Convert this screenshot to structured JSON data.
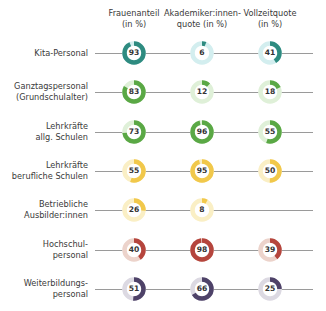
{
  "chart_data": {
    "type": "donut-matrix",
    "title": "",
    "columns": [
      "Frauenanteil (in %)",
      "Akademiker:innen-quote (in %)",
      "Vollzeitquote (in %)"
    ],
    "rows": [
      {
        "label": [
          "Kita-Personal"
        ],
        "values": [
          93,
          6,
          41
        ],
        "color": "#2e8b80",
        "track": "#d3eeef"
      },
      {
        "label": [
          "Ganztagspersonal",
          "(Grundschulalter)"
        ],
        "values": [
          83,
          12,
          18
        ],
        "color": "#5aa845",
        "track": "#dff0d8"
      },
      {
        "label": [
          "Lehrkräfte",
          "allg. Schulen"
        ],
        "values": [
          73,
          96,
          55
        ],
        "color": "#5aa845",
        "track": "#dff0d8"
      },
      {
        "label": [
          "Lehrkräfte",
          "berufliche Schulen"
        ],
        "values": [
          55,
          95,
          50
        ],
        "color": "#f1c84b",
        "track": "#faefc5"
      },
      {
        "label": [
          "Betriebliche",
          "Ausbilder:innen"
        ],
        "values": [
          26,
          8,
          null
        ],
        "color": "#f1c84b",
        "track": "#faefc5"
      },
      {
        "label": [
          "Hochschul-",
          "personal"
        ],
        "values": [
          40,
          98,
          39
        ],
        "color": "#b5453d",
        "track": "#ecd3cb"
      },
      {
        "label": [
          "Weiterbildungs-",
          "personal"
        ],
        "values": [
          51,
          66,
          25
        ],
        "color": "#4e4268",
        "track": "#dcd9e2"
      }
    ],
    "unit": "%",
    "range": [
      0,
      100
    ]
  },
  "headers": [
    [
      "Frauenanteil",
      "(in %)"
    ],
    [
      "Akademiker:innen-",
      "quote (in %)"
    ],
    [
      "Vollzeitquote",
      "(in %)"
    ]
  ]
}
